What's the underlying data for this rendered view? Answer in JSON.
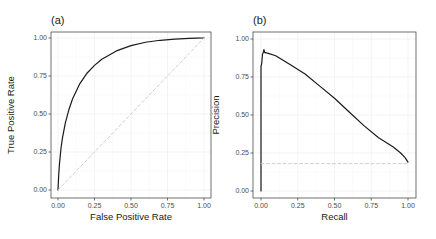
{
  "chart_data": [
    {
      "type": "line",
      "panel_label": "(a)",
      "title": "",
      "xlabel": "False Positive Rate",
      "ylabel": "True Positive Rate",
      "xlim": [
        0,
        1
      ],
      "ylim": [
        0,
        1
      ],
      "x_ticks": [
        "0.00",
        "0.25",
        "0.50",
        "0.75",
        "1.00"
      ],
      "y_ticks": [
        "0.00",
        "0.25",
        "0.50",
        "0.75",
        "1.00"
      ],
      "grid": true,
      "legend": "none",
      "series": [
        {
          "name": "ROC curve",
          "style": "solid",
          "color": "#1a1a1a",
          "x": [
            0.0,
            0.005,
            0.01,
            0.02,
            0.03,
            0.05,
            0.075,
            0.1,
            0.15,
            0.2,
            0.25,
            0.3,
            0.4,
            0.5,
            0.6,
            0.7,
            0.8,
            0.9,
            0.95,
            1.0
          ],
          "y": [
            0.0,
            0.1,
            0.17,
            0.27,
            0.34,
            0.44,
            0.53,
            0.6,
            0.7,
            0.77,
            0.82,
            0.86,
            0.915,
            0.95,
            0.972,
            0.985,
            0.993,
            0.998,
            0.999,
            1.0
          ]
        },
        {
          "name": "Chance diagonal",
          "style": "dashed",
          "color": "#c8c8c8",
          "x": [
            0,
            1
          ],
          "y": [
            0,
            1
          ]
        }
      ]
    },
    {
      "type": "line",
      "panel_label": "(b)",
      "title": "",
      "xlabel": "Recall",
      "ylabel": "Precision",
      "xlim": [
        0,
        1
      ],
      "ylim": [
        0,
        1
      ],
      "x_ticks": [
        "0.00",
        "0.25",
        "0.50",
        "0.75",
        "1.00"
      ],
      "y_ticks": [
        "0.00",
        "0.25",
        "0.50",
        "0.75",
        "1.00"
      ],
      "grid": true,
      "legend": "none",
      "series": [
        {
          "name": "Precision-Recall curve",
          "style": "solid",
          "color": "#1a1a1a",
          "x": [
            0.0,
            0.0,
            0.005,
            0.01,
            0.015,
            0.02,
            0.025,
            0.03,
            0.05,
            0.1,
            0.15,
            0.2,
            0.3,
            0.4,
            0.5,
            0.6,
            0.7,
            0.8,
            0.9,
            0.95,
            0.98,
            1.0
          ],
          "y": [
            0.0,
            0.82,
            0.84,
            0.9,
            0.91,
            0.93,
            0.91,
            0.91,
            0.905,
            0.89,
            0.86,
            0.83,
            0.77,
            0.69,
            0.61,
            0.52,
            0.43,
            0.35,
            0.29,
            0.25,
            0.22,
            0.19
          ]
        },
        {
          "name": "Baseline (positive rate)",
          "style": "dashed",
          "color": "#c8c8c8",
          "x": [
            0,
            1
          ],
          "y": [
            0.18,
            0.18
          ]
        }
      ]
    }
  ]
}
